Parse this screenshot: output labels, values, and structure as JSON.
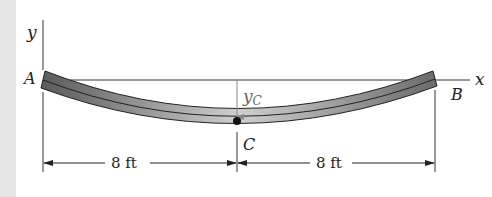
{
  "diagram": {
    "type": "simply-supported beam deflection",
    "axes": {
      "x_label": "x",
      "y_label": "y"
    },
    "points": {
      "A": "A",
      "B": "B",
      "C": "C"
    },
    "deflection_label": {
      "main": "y",
      "subscript": "C"
    },
    "dimensions": [
      {
        "label": "8 ft",
        "from": "A",
        "to": "C"
      },
      {
        "label": "8 ft",
        "from": "C",
        "to": "B"
      }
    ],
    "colors": {
      "beam_dark": "#555555",
      "beam_light": "#c8c8c8",
      "line": "#333333",
      "deflection_arrow": "#888888",
      "side_strip": "#e6e6e6"
    }
  }
}
